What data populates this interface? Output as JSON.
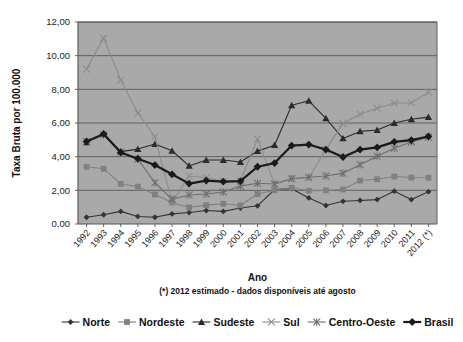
{
  "chart_data": {
    "type": "line",
    "title": "",
    "xlabel": "Ano",
    "ylabel": "Taxa Bruta por 100.000",
    "footnote": "(*) 2012 estimado - dados disponíveis até agosto",
    "grid": true,
    "legend_position": "bottom",
    "ylim": [
      0,
      12
    ],
    "ytick_labels": [
      "0,00",
      "2,00",
      "4,00",
      "6,00",
      "8,00",
      "10,00",
      "12,00"
    ],
    "ytick_values": [
      0,
      2,
      4,
      6,
      8,
      10,
      12
    ],
    "categories": [
      "1992",
      "1993",
      "1994",
      "1995",
      "1996",
      "1997",
      "1998",
      "1999",
      "2000",
      "2001",
      "2002",
      "2003",
      "2004",
      "2005",
      "2006",
      "2007",
      "2008",
      "2009",
      "2010",
      "2011",
      "2012 (*)"
    ],
    "series": [
      {
        "name": "Norte",
        "marker": "diamond",
        "color": "#333333",
        "values": [
          0.4,
          0.55,
          0.75,
          0.45,
          0.4,
          0.6,
          0.68,
          0.8,
          0.75,
          0.95,
          1.08,
          2.05,
          2.1,
          1.55,
          1.1,
          1.35,
          1.4,
          1.45,
          1.95,
          1.45,
          1.92
        ]
      },
      {
        "name": "Nordeste",
        "marker": "square",
        "color": "#808080",
        "values": [
          3.4,
          3.28,
          2.38,
          2.22,
          1.75,
          1.28,
          0.98,
          1.12,
          1.2,
          1.1,
          1.78,
          2.0,
          2.15,
          1.98,
          2.0,
          2.05,
          2.58,
          2.66,
          2.82,
          2.76,
          2.75
        ]
      },
      {
        "name": "Sudeste",
        "marker": "triangle",
        "color": "#2b2b2b",
        "values": [
          4.85,
          5.35,
          4.3,
          4.45,
          4.75,
          4.35,
          3.45,
          3.8,
          3.8,
          3.68,
          4.33,
          4.68,
          7.05,
          7.32,
          6.28,
          5.08,
          5.5,
          5.58,
          6.0,
          6.22,
          6.35
        ]
      },
      {
        "name": "Sul",
        "marker": "x",
        "color": "#8c8c8c",
        "values": [
          9.2,
          11.05,
          8.55,
          6.6,
          5.18,
          1.3,
          2.85,
          2.75,
          2.55,
          2.55,
          5.05,
          2.38,
          2.68,
          2.75,
          4.42,
          5.98,
          6.52,
          6.88,
          7.18,
          7.2,
          7.82
        ]
      },
      {
        "name": "Centro-Oeste",
        "marker": "asterisk",
        "color": "#6e6e6e",
        "values": [
          4.9,
          5.3,
          4.28,
          3.85,
          2.45,
          1.48,
          1.72,
          1.78,
          1.9,
          2.25,
          2.42,
          2.38,
          2.7,
          2.78,
          2.85,
          3.02,
          3.52,
          4.02,
          4.5,
          4.88,
          5.15
        ]
      },
      {
        "name": "Brasil",
        "marker": "diamond-bold",
        "color": "#1a1a1a",
        "values": [
          4.9,
          5.35,
          4.25,
          3.88,
          3.5,
          2.95,
          2.4,
          2.58,
          2.52,
          2.55,
          3.4,
          3.62,
          4.66,
          4.72,
          4.42,
          3.98,
          4.42,
          4.55,
          4.88,
          4.98,
          5.2
        ]
      }
    ]
  },
  "legend": {
    "items": [
      {
        "label": "Norte"
      },
      {
        "label": "Nordeste"
      },
      {
        "label": "Sudeste"
      },
      {
        "label": "Sul"
      },
      {
        "label": "Centro-Oeste"
      },
      {
        "label": "Brasil"
      }
    ]
  },
  "style": {
    "plot_background": "#a9a9a9",
    "page_background": "#ffffff",
    "gridline_color": "#595959",
    "axis_color": "#555555"
  }
}
